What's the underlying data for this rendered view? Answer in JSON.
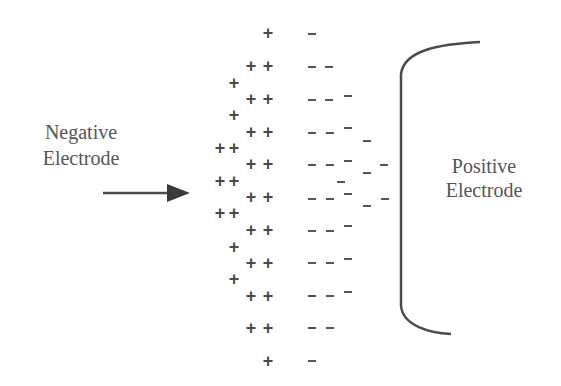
{
  "labels": {
    "negative_electrode": [
      "Negative",
      "Electrode"
    ],
    "positive_electrode": [
      "Positive",
      "Electrode"
    ]
  },
  "colors": {
    "ink": "#4a4a4a",
    "text": "#555555",
    "background": "#ffffff"
  },
  "charges": {
    "plus": [
      [
        268,
        33
      ],
      [
        251,
        66
      ],
      [
        268,
        66
      ],
      [
        234,
        83
      ],
      [
        251,
        99
      ],
      [
        268,
        99
      ],
      [
        234,
        115
      ],
      [
        251,
        132
      ],
      [
        268,
        132
      ],
      [
        220,
        148
      ],
      [
        234,
        148
      ],
      [
        251,
        164
      ],
      [
        268,
        164
      ],
      [
        220,
        181
      ],
      [
        234,
        181
      ],
      [
        251,
        197
      ],
      [
        268,
        197
      ],
      [
        220,
        213
      ],
      [
        234,
        213
      ],
      [
        251,
        230
      ],
      [
        268,
        230
      ],
      [
        234,
        247
      ],
      [
        251,
        263
      ],
      [
        268,
        263
      ],
      [
        234,
        279
      ],
      [
        251,
        296
      ],
      [
        268,
        296
      ],
      [
        251,
        328
      ],
      [
        268,
        328
      ],
      [
        268,
        361
      ]
    ],
    "minus": [
      [
        312,
        34
      ],
      [
        312,
        67
      ],
      [
        329,
        67
      ],
      [
        312,
        100
      ],
      [
        329,
        100
      ],
      [
        348,
        96
      ],
      [
        312,
        133
      ],
      [
        330,
        133
      ],
      [
        348,
        128
      ],
      [
        367,
        141
      ],
      [
        312,
        165
      ],
      [
        330,
        165
      ],
      [
        348,
        161
      ],
      [
        367,
        173
      ],
      [
        384,
        165
      ],
      [
        341,
        182
      ],
      [
        312,
        199
      ],
      [
        330,
        199
      ],
      [
        348,
        194
      ],
      [
        367,
        206
      ],
      [
        385,
        199
      ],
      [
        312,
        231
      ],
      [
        330,
        231
      ],
      [
        348,
        226
      ],
      [
        312,
        263
      ],
      [
        330,
        263
      ],
      [
        348,
        259
      ],
      [
        312,
        296
      ],
      [
        330,
        296
      ],
      [
        348,
        292
      ],
      [
        312,
        328
      ],
      [
        330,
        328
      ],
      [
        312,
        361
      ]
    ]
  },
  "arrow": {
    "x1": 103,
    "y": 193,
    "x2": 190,
    "head_start": 167
  },
  "bracket": {
    "top_end": [
      480,
      42
    ],
    "bottom_end": [
      451,
      334
    ],
    "x": 401,
    "top_y": 72,
    "bottom_y": 306
  }
}
